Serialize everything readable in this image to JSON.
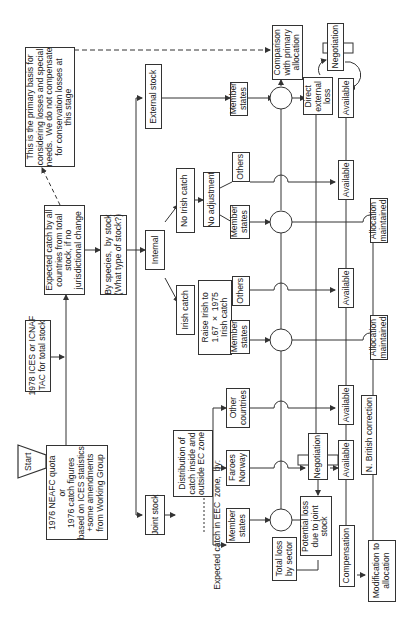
{
  "diagram": {
    "start": "Start",
    "tac": "1978 ICES or ICNAF\nTAC for total stock",
    "neafc": "1976 NEAFC quota\nor\n1976 catch figures\nbased on ICES statistics\n+some amendments\nfrom Working Group",
    "primary_basis": "This is the primary basis for\nconsidering losses and special\nneeds.  We do not compensate\nfor conservation losses at\nthis stage",
    "expected_catch": "Expected catch by all\ncountries from total\nstock, if no\njurisdictional change",
    "by_species": "By species,  by stock\n(What type of stock?)",
    "external_stock": "External stock",
    "internal": "Internal",
    "joint_stock": "Joint stock",
    "no_irish_catch": "No Irish catch",
    "irish_catch": "Irish catch",
    "no_adjustment": "No adjustment",
    "raise_irish": "Raise Irish to\n1.67  ×  1975\nIrish catch",
    "distribution": "Distribution of\ncatch inside and\noutside EC zone",
    "expected_eec": "Expected catch in EEC  zone,  by:",
    "member_states": "Member\nstates",
    "others": "Others",
    "faroes_norway": "Faroes\nNorway",
    "other_countries": "Other\ncountries",
    "comparison": "Comparison\nwith primary\nallocation",
    "direct_external_loss": "Direct\nexternal\nloss",
    "negotiation": "Negotiation",
    "available": "Available",
    "allocation_maintained": "Allocation\nmaintained",
    "potential_loss": "Potential loss\ndue to joint\nstock",
    "total_loss": "Total loss\nby sector",
    "compensation": "Compensation",
    "n_british": "N. British correction",
    "modification": "Modification to\nallocation"
  }
}
